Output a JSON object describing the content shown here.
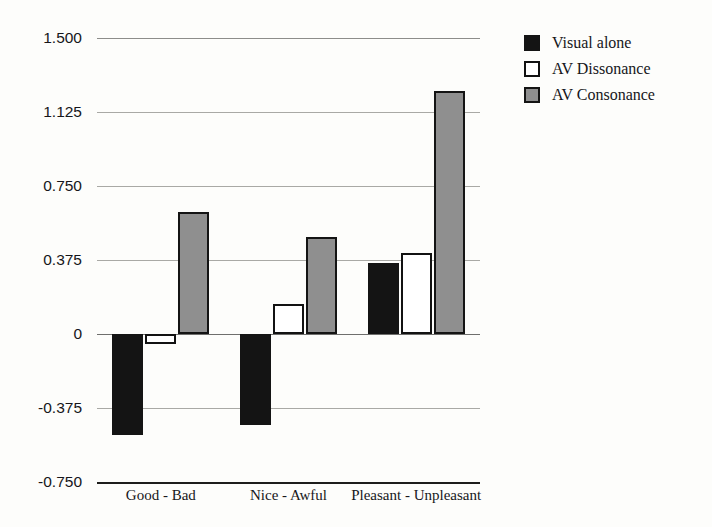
{
  "chart_data": {
    "type": "bar",
    "title": "",
    "subtitle": "",
    "xlabel": "",
    "ylabel": "",
    "categories": [
      "Good - Bad",
      "Nice - Awful",
      "Pleasant - Unpleasant"
    ],
    "series": [
      {
        "name": "Visual alone",
        "color": "#141414",
        "values": [
          -0.51,
          -0.46,
          0.36
        ]
      },
      {
        "name": "AV Dissonance",
        "color": "#ffffff",
        "values": [
          -0.05,
          0.15,
          0.41
        ]
      },
      {
        "name": "AV Consonance",
        "color": "#8f8f8f",
        "values": [
          0.62,
          0.49,
          1.23
        ]
      }
    ],
    "ylim": [
      -0.75,
      1.5
    ],
    "yticks": [
      1.5,
      1.125,
      0.75,
      0.375,
      0,
      -0.375,
      -0.75
    ],
    "ytick_labels": [
      "1.500",
      "1.125",
      "0.750",
      "0.375",
      "0",
      "-0.375",
      "-0.750"
    ],
    "grid": true,
    "legend_position": "right-top",
    "bar_outline_color": "#111111"
  },
  "legend": {
    "items": [
      {
        "label": "Visual alone",
        "swatch": "black-square-icon"
      },
      {
        "label": "AV Dissonance",
        "swatch": "white-square-icon"
      },
      {
        "label": "AV Consonance",
        "swatch": "gray-square-icon"
      }
    ]
  }
}
